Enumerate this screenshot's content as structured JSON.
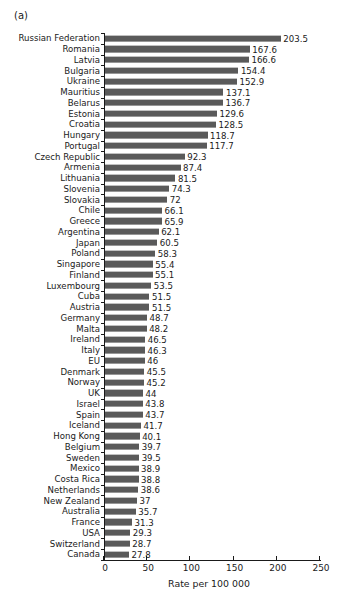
{
  "panel": {
    "label": "(a)"
  },
  "chart_data": {
    "type": "bar",
    "orientation": "horizontal",
    "title": "",
    "subtitle": "",
    "panel_label": "(a)",
    "xlabel": "Rate per 100 000",
    "ylabel": "",
    "xlim": [
      0,
      250
    ],
    "xticks": [
      0,
      50,
      100,
      150,
      200,
      250
    ],
    "xticklabels": [
      "0",
      "50",
      "100",
      "150",
      "200",
      "250"
    ],
    "grid": false,
    "legend": false,
    "bar_color": "#5a5a5a",
    "text_color": "#1a1a1a",
    "background": "#ffffff",
    "value_labels": true,
    "categories": [
      "Russian Federation",
      "Romania",
      "Latvia",
      "Bulgaria",
      "Ukraine",
      "Mauritius",
      "Belarus",
      "Estonia",
      "Croatia",
      "Hungary",
      "Portugal",
      "Czech Republic",
      "Armenia",
      "Lithuania",
      "Slovenia",
      "Slovakia",
      "Chile",
      "Greece",
      "Argentina",
      "Japan",
      "Poland",
      "Singapore",
      "Finland",
      "Luxembourg",
      "Cuba",
      "Austria",
      "Germany",
      "Malta",
      "Ireland",
      "Italy",
      "EU",
      "Denmark",
      "Norway",
      "UK",
      "Israel",
      "Spain",
      "Iceland",
      "Hong Kong",
      "Belgium",
      "Sweden",
      "Mexico",
      "Costa Rica",
      "Netherlands",
      "New Zealand",
      "Australia",
      "France",
      "USA",
      "Switzerland",
      "Canada"
    ],
    "values": [
      203.5,
      167.6,
      166.6,
      154.4,
      152.9,
      137.1,
      136.7,
      129.6,
      128.5,
      118.7,
      117.7,
      92.3,
      87.4,
      81.5,
      74.3,
      72,
      66.1,
      65.9,
      62.1,
      60.5,
      58.3,
      55.4,
      55.1,
      53.5,
      51.5,
      51.5,
      48.7,
      48.2,
      46.5,
      46.3,
      46,
      45.5,
      45.2,
      44,
      43.8,
      43.7,
      41.7,
      40.1,
      39.7,
      39.5,
      38.9,
      38.8,
      38.6,
      37,
      35.7,
      31.3,
      29.3,
      28.7,
      27.8
    ],
    "value_label_text": [
      "203.5",
      "167.6",
      "166.6",
      "154.4",
      "152.9",
      "137.1",
      "136.7",
      "129.6",
      "128.5",
      "118.7",
      "117.7",
      "92.3",
      "87.4",
      "81.5",
      "74.3",
      "72",
      "66.1",
      "65.9",
      "62.1",
      "60.5",
      "58.3",
      "55.4",
      "55.1",
      "53.5",
      "51.5",
      "51.5",
      "48.7",
      "48.2",
      "46.5",
      "46.3",
      "46",
      "45.5",
      "45.2",
      "44",
      "43.8",
      "43.7",
      "41.7",
      "40.1",
      "39.7",
      "39.5",
      "38.9",
      "38.8",
      "38.6",
      "37",
      "35.7",
      "31.3",
      "29.3",
      "28.7",
      "27.8"
    ]
  }
}
